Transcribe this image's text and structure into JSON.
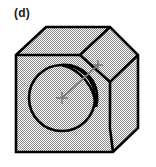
{
  "figure": {
    "panel_label": "(d)",
    "caption_text": "",
    "colors": {
      "outline": "#000000",
      "face_fill_pattern": "#808080",
      "face_fill_base": "#ffffff",
      "cut_region_fill": "#ffffff",
      "dimension_line": "#7a7a7a",
      "label_text": "#1a1a1a",
      "background": "#ffffff"
    },
    "geometry": {
      "front_face": {
        "name": "front-face",
        "vertices": "16,55 46,27 110,27 110,82 110,128 113,152 16,152"
      },
      "top_face": {
        "name": "top-face",
        "vertices": "16,55 46,27 110,27 80,55"
      },
      "right_face": {
        "name": "right-face",
        "vertices": "110,82 138,55 138,128 113,152"
      },
      "chamfer_face": {
        "name": "chamfer-face",
        "vertices": "110,27 138,55 110,82 80,55"
      },
      "circle": {
        "cx": 62,
        "cy": 98,
        "r": 33
      },
      "lens": {
        "start": "62,65",
        "end": "96,107",
        "arc1_sweep": "outer-right",
        "arc2_sweep": "inner-left"
      },
      "dimension_line": {
        "x1": 62,
        "y1": 98,
        "x2": 99,
        "y2": 64
      },
      "tick_marks": [
        {
          "name": "centre-cross",
          "x": 62,
          "y": 98
        },
        {
          "name": "end-cross",
          "x": 98,
          "y": 65
        }
      ]
    }
  }
}
